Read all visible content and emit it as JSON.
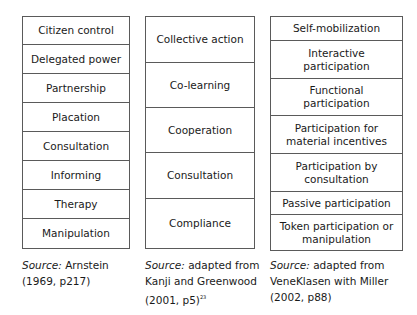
{
  "ladders": [
    {
      "rungs": [
        "Citizen control",
        "Delegated power",
        "Partnership",
        "Placation",
        "Consultation",
        "Informing",
        "Therapy",
        "Manipulation"
      ],
      "source": {
        "label": "Source:",
        "line1": " Arnstein",
        "line2": "(1969, p217)"
      }
    },
    {
      "rungs": [
        "Collective action",
        "Co-learning",
        "Cooperation",
        "Consultation",
        "Compliance"
      ],
      "source": {
        "label": "Source:",
        "line1": " adapted from",
        "line2": "Kanji and Greenwood",
        "line3": "(2001, p5)",
        "sup": "23"
      }
    },
    {
      "rungs": [
        "Self-mobilization",
        "Interactive participation",
        "Functional participation",
        "Participation for material incentives",
        "Participation by consultation",
        "Passive participation",
        "Token participation or manipulation"
      ],
      "source": {
        "label": "Source:",
        "line1": " adapted from",
        "line2": "VeneKlasen with Miller",
        "line3": "(2002, p88)"
      }
    }
  ]
}
